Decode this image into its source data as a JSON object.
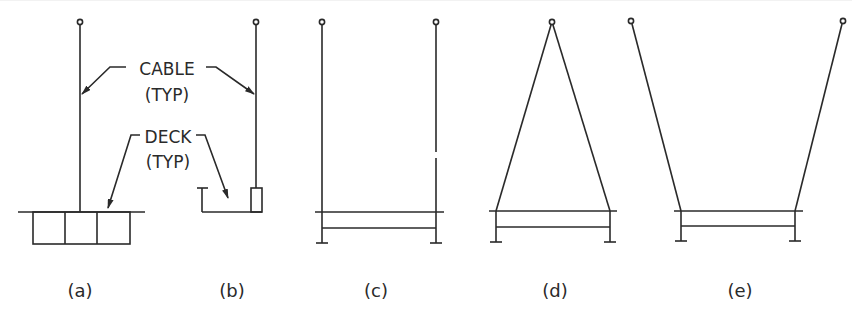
{
  "diagram": {
    "annotations": {
      "cable": {
        "line1": "CABLE",
        "line2": "(TYP)"
      },
      "deck": {
        "line1": "DECK",
        "line2": "(TYP)"
      }
    },
    "panels": [
      {
        "id": "a",
        "label": "(a)",
        "description": "Single vertical cable supporting box-section deck (cross-section)"
      },
      {
        "id": "b",
        "label": "(b)",
        "description": "Single vertical cable at deck edge (cross-section)"
      },
      {
        "id": "c",
        "label": "(c)",
        "description": "Two vertical cables, one at each deck edge"
      },
      {
        "id": "d",
        "label": "(d)",
        "description": "Two inclined cables meeting at a single top anchor (A-frame)"
      },
      {
        "id": "e",
        "label": "(e)",
        "description": "Two outward-inclined cables (V-shape)"
      }
    ],
    "colors": {
      "line": "#2a2a2a",
      "background": "#ffffff"
    }
  }
}
